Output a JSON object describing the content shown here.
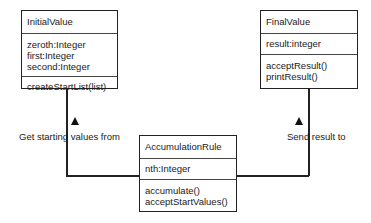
{
  "classes": {
    "initial": {
      "name": "InitialValue",
      "attributes": [
        "zeroth:Integer",
        "first:Integer",
        "second:Integer"
      ],
      "methods": [
        "createStartList(list)"
      ]
    },
    "final": {
      "name": "FinalValue",
      "attributes": [
        "result:integer"
      ],
      "methods": [
        "acceptResult()",
        "printResult()"
      ]
    },
    "rule": {
      "name": "AccumulationRule",
      "attributes": [
        "nth:Integer"
      ],
      "methods": [
        "accumulate()",
        "acceptStartValues()"
      ]
    }
  },
  "associations": {
    "left_label": "Get starting values from",
    "right_label": "Send result to"
  }
}
